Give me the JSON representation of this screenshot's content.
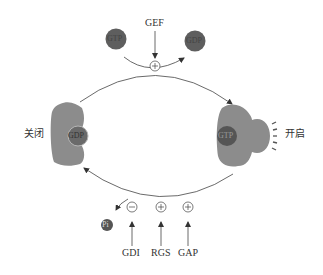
{
  "diagram": {
    "top": {
      "regulator": "GEF",
      "regulator_effect": "+",
      "incoming_nucleotide": "GTP",
      "outgoing_nucleotide": "GDP"
    },
    "states": {
      "off": {
        "label": "关闭",
        "bound_nucleotide": "GDP"
      },
      "on": {
        "label": "开启",
        "bound_nucleotide": "GTP"
      }
    },
    "bottom": {
      "released": "Pi",
      "regulators": [
        {
          "label": "GDI",
          "effect": "−"
        },
        {
          "label": "RGS",
          "effect": "+"
        },
        {
          "label": "GAP",
          "effect": "+"
        }
      ]
    },
    "colors": {
      "protein": "#8c8c8c",
      "nucleotide_dark": "#5a5a5a",
      "line": "#444444",
      "text": "#333333"
    }
  }
}
